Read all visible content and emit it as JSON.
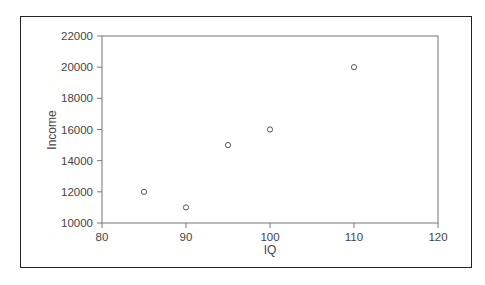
{
  "chart_data": {
    "type": "scatter",
    "title": "",
    "xlabel": "IQ",
    "ylabel": "Income",
    "xlim": [
      80,
      120
    ],
    "ylim": [
      10000,
      22000
    ],
    "x_ticks": [
      80,
      90,
      100,
      110,
      120
    ],
    "y_ticks": [
      10000,
      12000,
      14000,
      16000,
      18000,
      20000,
      22000
    ],
    "grid": false,
    "legend": null,
    "series": [
      {
        "name": "Income vs IQ",
        "marker": "open-circle",
        "x": [
          85,
          90,
          95,
          100,
          110
        ],
        "y": [
          12000,
          11000,
          15000,
          16000,
          20000
        ]
      }
    ]
  },
  "colors": {
    "frame": "#222222",
    "axis": "#777777",
    "marker": "#555555",
    "text": "#444444"
  }
}
